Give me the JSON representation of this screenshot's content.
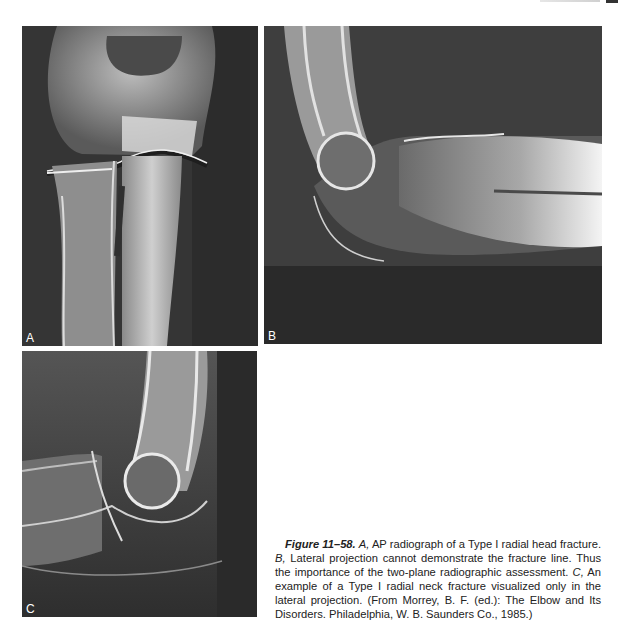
{
  "panels": [
    {
      "id": "A",
      "label": "A",
      "description": "AP radiograph of elbow showing Type I radial head fracture"
    },
    {
      "id": "B",
      "label": "B",
      "description": "Lateral radiograph of elbow"
    },
    {
      "id": "C",
      "label": "C",
      "description": "Lateral radiograph showing Type I radial neck fracture"
    }
  ],
  "caption": {
    "figure_label": "Figure 11–58.",
    "part_a_letter": "A,",
    "part_a_text": " AP radiograph of a Type I radial head fracture. ",
    "part_b_letter": "B,",
    "part_b_text": " Lateral projection cannot demonstrate the fracture line. Thus the importance of the two-plane radiographic assessment. ",
    "part_c_letter": "C,",
    "part_c_text": " An example of a Type I radial neck fracture visualized only in the lateral projection. (From Morrey, B. F. (ed.): The Elbow and Its Disorders. Philadelphia, W. B. Saunders Co., 1985.)"
  },
  "colors": {
    "xray_background": "#3a3a3a",
    "bone": "#d8d8d8",
    "text": "#222222"
  }
}
